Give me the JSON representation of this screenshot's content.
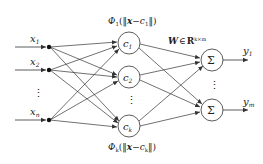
{
  "diagram": {
    "inputs": [
      {
        "label": "x",
        "sub": "1",
        "y": 47
      },
      {
        "label": "x",
        "sub": "2",
        "y": 70
      },
      {
        "label": "x",
        "sub": "n",
        "y": 120
      }
    ],
    "input_ellipsis": "⋮",
    "hidden": [
      {
        "label": "c",
        "sub": "1",
        "y": 43
      },
      {
        "label": "c",
        "sub": "2",
        "y": 77
      },
      {
        "label": "c",
        "sub": "k",
        "y": 126
      }
    ],
    "hidden_ellipsis": "⋮",
    "outputs": [
      {
        "symbol": "Σ",
        "label": "y",
        "sub": "1",
        "y": 60
      },
      {
        "symbol": "Σ",
        "label": "y",
        "sub": "m",
        "y": 110
      }
    ],
    "output_ellipsis": "⋮",
    "phi_top": {
      "phi": "Φ",
      "sub": "1",
      "open": "(‖",
      "x": "x",
      "minus": "−",
      "c": "c",
      "csub": "1",
      "close": "‖)"
    },
    "phi_bottom": {
      "phi": "Φ",
      "sub": "k",
      "open": "(‖",
      "x": "x",
      "minus": "−",
      "c": "c",
      "csub": "k",
      "close": "‖)"
    },
    "weight_label": {
      "W": "W",
      "in": "∈",
      "R": "R",
      "sup": "k×m"
    },
    "colors": {
      "line": "#333333",
      "node_fill": "#ffffff",
      "dot": "#111111"
    }
  }
}
